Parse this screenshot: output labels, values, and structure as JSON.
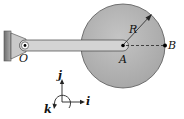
{
  "figure": {
    "labels": {
      "pivot": "O",
      "disc_center": "A",
      "rim_point": "B",
      "radius": "R"
    },
    "axes": {
      "x": "i",
      "y": "j",
      "z": "k"
    },
    "colors": {
      "disc": "#b5b5b5",
      "disc_edge": "#555555",
      "bar": "#d2d2d2",
      "bar_edge": "#444444",
      "wall": "#8f8f8f",
      "background": "#ffffff"
    }
  }
}
